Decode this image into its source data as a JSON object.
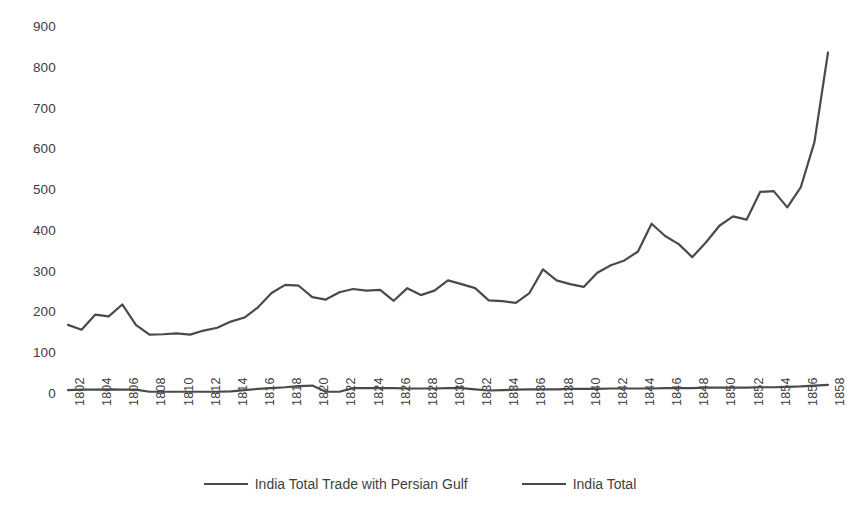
{
  "chart_data": {
    "type": "line",
    "title": "",
    "xlabel": "",
    "ylabel": "",
    "grid": false,
    "legend_position": "bottom",
    "ylim": [
      0,
      900
    ],
    "ytick_labels": [
      "900",
      "800",
      "700",
      "600",
      "500",
      "400",
      "300",
      "200",
      "100",
      "0"
    ],
    "ytick_values": [
      900,
      800,
      700,
      600,
      500,
      400,
      300,
      200,
      100,
      0
    ],
    "x": [
      1802,
      1803,
      1804,
      1805,
      1806,
      1807,
      1808,
      1809,
      1810,
      1811,
      1812,
      1813,
      1814,
      1815,
      1816,
      1817,
      1818,
      1819,
      1820,
      1821,
      1822,
      1823,
      1824,
      1825,
      1826,
      1827,
      1828,
      1829,
      1830,
      1831,
      1832,
      1833,
      1834,
      1835,
      1836,
      1837,
      1838,
      1839,
      1840,
      1841,
      1842,
      1843,
      1844,
      1845,
      1846,
      1847,
      1848,
      1849,
      1850,
      1851,
      1852,
      1853,
      1854,
      1855,
      1856,
      1857,
      1858
    ],
    "xtick_labels": [
      "1802",
      "1804",
      "1806",
      "1808",
      "1810",
      "1812",
      "1814",
      "1816",
      "1818",
      "1820",
      "1822",
      "1824",
      "1826",
      "1828",
      "1830",
      "1832",
      "1834",
      "1836",
      "1838",
      "1840",
      "1842",
      "1844",
      "1846",
      "1848",
      "1850",
      "1852",
      "1854",
      "1856",
      "1858"
    ],
    "xtick_values": [
      1802,
      1804,
      1806,
      1808,
      1810,
      1812,
      1814,
      1816,
      1818,
      1820,
      1822,
      1824,
      1826,
      1828,
      1830,
      1832,
      1834,
      1836,
      1838,
      1840,
      1842,
      1844,
      1846,
      1848,
      1850,
      1852,
      1854,
      1856,
      1858
    ],
    "series": [
      {
        "name": "India Total",
        "color": "#4a4a4a",
        "values": [
          172,
          160,
          197,
          193,
          222,
          172,
          148,
          149,
          151,
          148,
          158,
          165,
          180,
          190,
          215,
          250,
          270,
          268,
          240,
          234,
          252,
          260,
          256,
          258,
          231,
          262,
          245,
          256,
          281,
          272,
          262,
          232,
          230,
          226,
          250,
          308,
          281,
          272,
          265,
          300,
          318,
          330,
          352,
          420,
          390,
          370,
          338,
          374,
          415,
          438,
          430,
          498,
          500,
          460,
          510,
          620,
          840
        ]
      },
      {
        "name": "India Total Trade with Persian Gulf",
        "color": "#4a4a4a",
        "values": [
          12,
          13,
          13,
          14,
          13,
          13,
          8,
          8,
          8,
          8,
          8,
          8,
          9,
          12,
          15,
          17,
          19,
          22,
          23,
          8,
          8,
          17,
          17,
          17,
          17,
          16,
          16,
          16,
          17,
          17,
          14,
          11,
          12,
          13,
          14,
          14,
          14,
          15,
          15,
          15,
          16,
          16,
          16,
          16,
          17,
          17,
          17,
          18,
          18,
          18,
          18,
          19,
          19,
          20,
          21,
          23,
          25
        ]
      }
    ]
  },
  "legend": {
    "entries": [
      {
        "label": "India Total Trade with Persian Gulf"
      },
      {
        "label": "India Total"
      }
    ]
  },
  "colors": {
    "line": "#4a4a4a",
    "text": "#404040",
    "background": "#ffffff"
  }
}
